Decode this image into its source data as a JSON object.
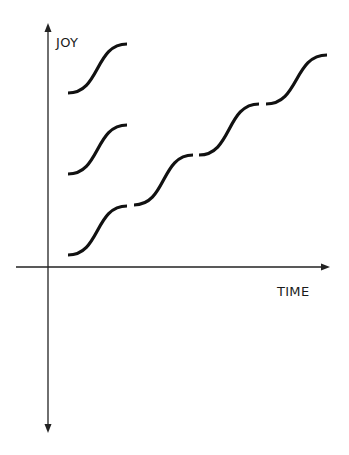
{
  "axes": {
    "y_label": "JOY",
    "x_label": "TIME"
  },
  "colors": {
    "ink": "#111111",
    "background": "#ffffff"
  },
  "curves": [
    {
      "name": "isolated-step-top",
      "from": [
        68,
        93
      ],
      "to": [
        127,
        44
      ]
    },
    {
      "name": "isolated-step-middle",
      "from": [
        68,
        174
      ],
      "to": [
        127,
        125
      ]
    },
    {
      "name": "staircase-step-1",
      "from": [
        68,
        255
      ],
      "to": [
        127,
        206
      ]
    },
    {
      "name": "staircase-step-2",
      "from": [
        134,
        205
      ],
      "to": [
        193,
        155
      ]
    },
    {
      "name": "staircase-step-3",
      "from": [
        199,
        155
      ],
      "to": [
        259,
        104
      ]
    },
    {
      "name": "staircase-step-4",
      "from": [
        266,
        104
      ],
      "to": [
        327,
        55
      ]
    }
  ]
}
